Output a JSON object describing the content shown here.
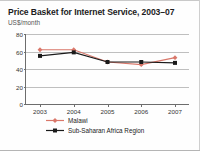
{
  "chart_data": {
    "type": "line",
    "title": "Price Basket for Internet Service, 2003–07",
    "subtitle": "US$/month",
    "xlabel": "",
    "ylabel": "US$/month",
    "categories": [
      "2003",
      "2004",
      "2005",
      "2006",
      "2007"
    ],
    "x": [
      2003,
      2004,
      2005,
      2006,
      2007
    ],
    "ylim": [
      0,
      80
    ],
    "yticks": [
      0,
      20,
      40,
      60,
      80
    ],
    "grid": true,
    "legend_position": "bottom",
    "series": [
      {
        "name": "Malawi",
        "color": "#d9776a",
        "marker": "diamond",
        "values": [
          62,
          62,
          48,
          45,
          53
        ]
      },
      {
        "name": "Sub-Saharan Africa Region",
        "color": "#1a1a1a",
        "marker": "square",
        "values": [
          55,
          59,
          48,
          48,
          47
        ]
      }
    ]
  },
  "legend": {
    "items": [
      {
        "label": "Malawi",
        "color": "#d9776a",
        "marker": "diamond"
      },
      {
        "label": "Sub-Saharan Africa Region",
        "color": "#1a1a1a",
        "marker": "square"
      }
    ]
  },
  "axis": {
    "y_tick_labels": [
      "80",
      "60",
      "40",
      "20",
      "0"
    ],
    "x_tick_labels": [
      "2003",
      "2004",
      "2005",
      "2006",
      "2007"
    ]
  }
}
